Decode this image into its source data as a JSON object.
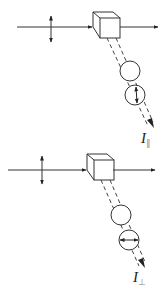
{
  "diagram": {
    "stroke_color": "#333333",
    "panels": [
      {
        "id": "parallel",
        "incident_polarization": "vertical",
        "analyzer_polarization": "vertical",
        "label": {
          "symbol": "I",
          "subscript": "∥"
        }
      },
      {
        "id": "perpendicular",
        "incident_polarization": "vertical",
        "analyzer_polarization": "horizontal",
        "label": {
          "symbol": "I",
          "subscript": "⊥"
        }
      }
    ]
  }
}
